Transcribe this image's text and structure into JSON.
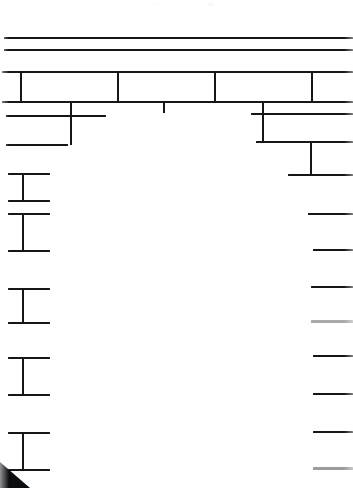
{
  "document": {
    "kind": "scanned-table-page",
    "page_width": 353,
    "page_height": 488,
    "background_color": "#ffffff",
    "ink_color": "#14161a",
    "faded_ink_color": "#a9a9a9"
  },
  "ghost_text": [
    {
      "text": "·· ··",
      "x": 64,
      "y": 0
    },
    {
      "text": "·· ···",
      "x": 148,
      "y": 0
    },
    {
      "text": "·o·",
      "x": 206,
      "y": 0
    }
  ],
  "top_rules": [
    {
      "name": "top-rule-1",
      "x": 4,
      "y": 37,
      "width": 349,
      "height": 2.2,
      "color": "#14161a"
    },
    {
      "name": "top-rule-2",
      "x": 4,
      "y": 49,
      "width": 349,
      "height": 2.2,
      "color": "#14161a"
    },
    {
      "name": "top-rule-3",
      "x": 2,
      "y": 71,
      "width": 351,
      "height": 2.4,
      "color": "#14161a"
    }
  ],
  "header_band": {
    "name": "header-row",
    "top": 72,
    "bottom": 102,
    "left": 2,
    "right": 353,
    "bottom_rule": {
      "x": 2,
      "y": 101,
      "width": 351,
      "height": 2.4
    },
    "dividers": [
      {
        "name": "header-divider-1",
        "x": 20,
        "y": 73,
        "height": 29
      },
      {
        "name": "header-divider-2",
        "x": 117,
        "y": 73,
        "height": 29
      },
      {
        "name": "header-divider-3",
        "x": 214,
        "y": 73,
        "height": 29
      },
      {
        "name": "header-divider-4",
        "x": 311,
        "y": 73,
        "height": 29
      }
    ],
    "cells": [
      {
        "name": "header-cell-1",
        "label": ""
      },
      {
        "name": "header-cell-2",
        "label": ""
      },
      {
        "name": "header-cell-3",
        "label": ""
      },
      {
        "name": "header-cell-4",
        "label": ""
      }
    ]
  },
  "stubs": [
    {
      "name": "stub-left",
      "x": 70,
      "y": 102,
      "height": 14
    },
    {
      "name": "stub-center",
      "x": 163,
      "y": 102,
      "height": 11
    },
    {
      "name": "stub-right",
      "x": 262,
      "y": 102,
      "height": 14
    }
  ],
  "left_brackets": [
    {
      "name": "left-bracket-1",
      "top_rule": {
        "x": 6,
        "y": 115,
        "width": 100,
        "height": 2.4
      },
      "bottom_rule": {
        "x": 6,
        "y": 144,
        "width": 62,
        "height": 2.4
      },
      "stem": {
        "x": 70,
        "y": 116,
        "height": 29
      }
    },
    {
      "name": "left-bracket-2",
      "top_rule": {
        "x": 8,
        "y": 173,
        "width": 42,
        "height": 2.4
      },
      "bottom_rule": {
        "x": 8,
        "y": 200,
        "width": 42,
        "height": 2.4
      },
      "stem": {
        "x": 22,
        "y": 174,
        "height": 27
      }
    },
    {
      "name": "left-bracket-3",
      "top_rule": {
        "x": 8,
        "y": 213,
        "width": 42,
        "height": 2.4
      },
      "bottom_rule": {
        "x": 8,
        "y": 250,
        "width": 42,
        "height": 2.4
      },
      "stem": {
        "x": 22,
        "y": 214,
        "height": 37
      }
    },
    {
      "name": "left-bracket-4",
      "top_rule": {
        "x": 8,
        "y": 288,
        "width": 42,
        "height": 2.4
      },
      "bottom_rule": {
        "x": 8,
        "y": 322,
        "width": 42,
        "height": 2.4
      },
      "stem": {
        "x": 22,
        "y": 289,
        "height": 34
      }
    },
    {
      "name": "left-bracket-5",
      "top_rule": {
        "x": 8,
        "y": 357,
        "width": 42,
        "height": 2.4
      },
      "bottom_rule": {
        "x": 8,
        "y": 394,
        "width": 42,
        "height": 2.4
      },
      "stem": {
        "x": 22,
        "y": 358,
        "height": 37
      }
    },
    {
      "name": "left-bracket-6",
      "top_rule": {
        "x": 8,
        "y": 432,
        "width": 42,
        "height": 2.4
      },
      "bottom_rule": {
        "x": 8,
        "y": 469,
        "width": 42,
        "height": 2.4
      },
      "stem": {
        "x": 22,
        "y": 433,
        "height": 37
      }
    }
  ],
  "right_brackets": [
    {
      "name": "right-bracket-1",
      "top_rule": {
        "x": 251,
        "y": 113,
        "width": 102,
        "height": 2.4
      },
      "bottom_rule": {
        "x": 256,
        "y": 141,
        "width": 97,
        "height": 2.4
      },
      "stem": {
        "x": 262,
        "y": 114,
        "height": 28
      }
    },
    {
      "name": "right-bracket-2",
      "top_rule": {
        "x": 256,
        "y": 141,
        "width": 97,
        "height": 2.4
      },
      "bottom_rule": {
        "x": 288,
        "y": 174,
        "width": 65,
        "height": 2.4
      },
      "stem": {
        "x": 310,
        "y": 142,
        "height": 33
      }
    }
  ],
  "right_rules": [
    {
      "name": "right-rule-1",
      "x": 308,
      "y": 213,
      "width": 45,
      "height": 2.4,
      "color": "#14161a"
    },
    {
      "name": "right-rule-2",
      "x": 313,
      "y": 249,
      "width": 40,
      "height": 2.4,
      "color": "#14161a"
    },
    {
      "name": "right-rule-3",
      "x": 311,
      "y": 286,
      "width": 42,
      "height": 2.4,
      "color": "#14161a"
    },
    {
      "name": "right-rule-4",
      "x": 311,
      "y": 320,
      "width": 42,
      "height": 2.6,
      "color": "#a9a9a9"
    },
    {
      "name": "right-rule-5",
      "x": 313,
      "y": 355,
      "width": 40,
      "height": 2.4,
      "color": "#14161a"
    },
    {
      "name": "right-rule-6",
      "x": 313,
      "y": 393,
      "width": 40,
      "height": 2.4,
      "color": "#14161a"
    },
    {
      "name": "right-rule-7",
      "x": 313,
      "y": 431,
      "width": 40,
      "height": 2.4,
      "color": "#14161a"
    },
    {
      "name": "right-rule-8",
      "x": 313,
      "y": 467,
      "width": 40,
      "height": 2.6,
      "color": "#9c9c9c"
    }
  ],
  "artifacts": {
    "corner_wedge": {
      "name": "scan-corner-wedge",
      "x": 0,
      "y": 462,
      "width": 30,
      "height": 26,
      "color": "#0c0d10"
    }
  }
}
